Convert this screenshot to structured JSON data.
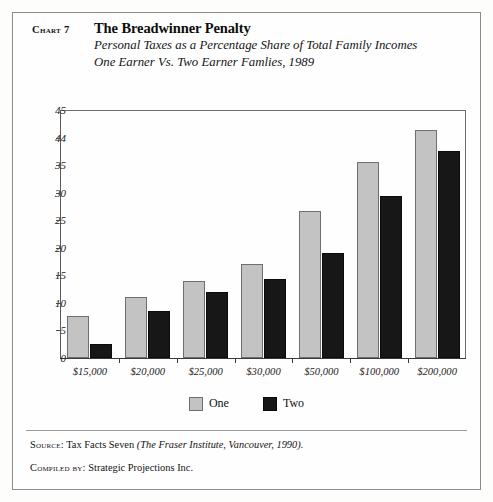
{
  "header": {
    "chart_label": "Chart 7",
    "title": "The Breadwinner Penalty",
    "subtitle_line1": "Personal Taxes as a Percentage Share of Total Family Incomes",
    "subtitle_line2": "One Earner Vs. Two Earner Famlies, 1989"
  },
  "legend": {
    "one_label": "One",
    "two_label": "Two"
  },
  "footer": {
    "source_prefix": "Source:",
    "source_text": "Tax Facts Seven ",
    "source_italic": "(The Fraser Institute, Vancouver, 1990).",
    "compiled_prefix": "Compiled by:",
    "compiled_text": "Strategic Projections Inc."
  },
  "colors": {
    "one": "#c3c3c3",
    "two": "#171717",
    "axis": "#3a3a3a",
    "frame": "#8b8b8b"
  },
  "chart_data": {
    "type": "bar",
    "title": "The Breadwinner Penalty",
    "subtitle": "Personal Taxes as a Percentage Share of Total Family Incomes One Earner Vs. Two Earner Famlies, 1989",
    "xlabel": "",
    "ylabel": "",
    "categories": [
      "$15,000",
      "$20,000",
      "$25,000",
      "$30,000",
      "$50,000",
      "$100,000",
      "$200,000"
    ],
    "series": [
      {
        "name": "One",
        "values": [
          7.6,
          11.1,
          14.0,
          17.0,
          26.6,
          35.6,
          41.3
        ]
      },
      {
        "name": "Two",
        "values": [
          2.5,
          8.5,
          12.0,
          14.3,
          19.0,
          29.4,
          37.5
        ]
      }
    ],
    "ylim": [
      0,
      45
    ],
    "yticks": [
      0,
      5,
      10,
      15,
      20,
      25,
      30,
      35,
      44,
      45
    ],
    "ytick_labels": [
      "0",
      "5",
      "10",
      "15",
      "20",
      "25",
      "30",
      "35",
      "44",
      "45"
    ],
    "grid": false,
    "legend_position": "bottom"
  }
}
